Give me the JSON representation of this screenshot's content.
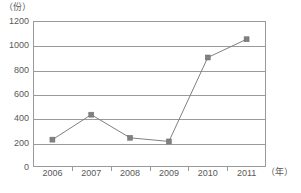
{
  "chart_data": {
    "type": "line",
    "title": "",
    "subtitle": "",
    "xlabel": "（年）",
    "ylabel": "（份）",
    "categories": [
      "2006",
      "2007",
      "2008",
      "2009",
      "2010",
      "2011"
    ],
    "values": [
      225,
      430,
      240,
      210,
      900,
      1050
    ],
    "series": [
      {
        "name": "",
        "values": [
          225,
          430,
          240,
          210,
          900,
          1050
        ],
        "marker": "square",
        "color": "#808080"
      }
    ],
    "ylim": [
      0,
      1200
    ],
    "yticks": [
      0,
      200,
      400,
      600,
      800,
      1000,
      1200
    ],
    "ytick_labels": [
      "0",
      "200",
      "400",
      "600",
      "800",
      "1000",
      "1200"
    ],
    "xtick_labels": [
      "2006",
      "2007",
      "2008",
      "2009",
      "2010",
      "2011"
    ],
    "grid": "horizontal",
    "legend": "none",
    "line_color": "#808080",
    "marker_color": "#808080",
    "axis_color": "#9a9a9a",
    "text_color": "#595959",
    "background": "#ffffff"
  },
  "axes": {
    "y_unit_label": "（份）",
    "x_unit_label": "（年）"
  },
  "footnote": {
    "text": ""
  }
}
